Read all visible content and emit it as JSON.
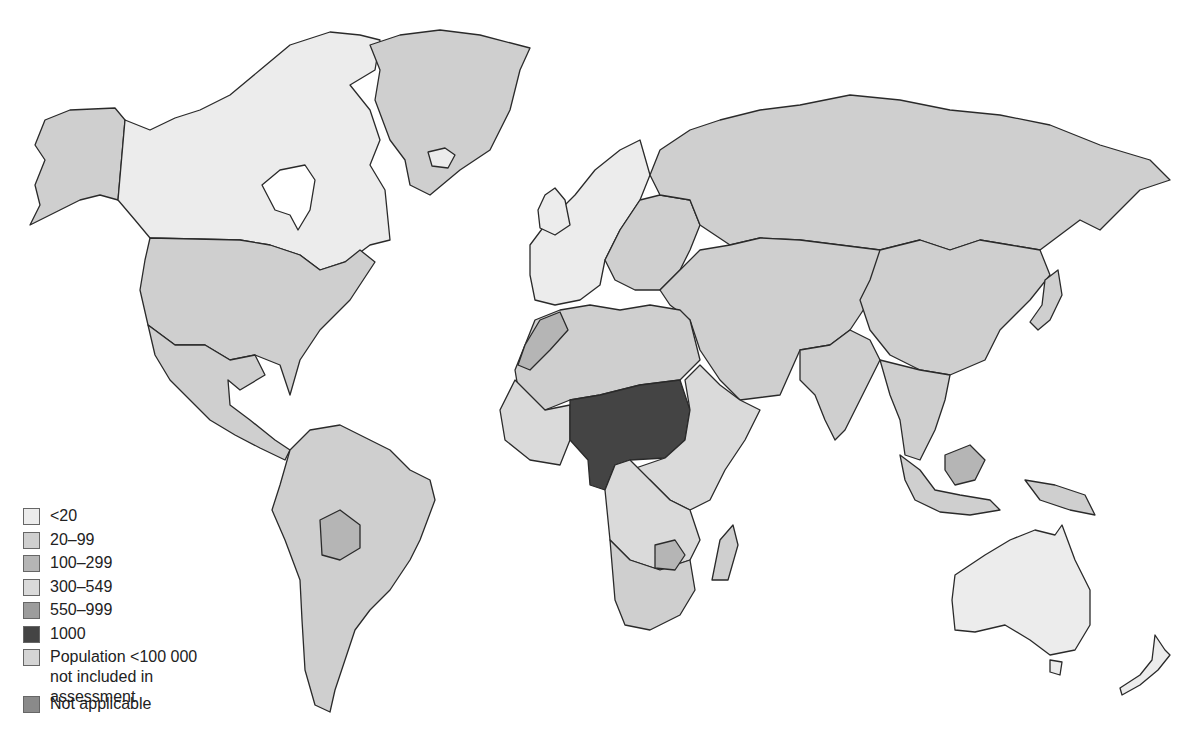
{
  "map": {
    "type": "choropleth",
    "subject": "World map shaded by category",
    "classes": [
      {
        "key": "lt20",
        "label": "<20",
        "color": "#ececec"
      },
      {
        "key": "c20_99",
        "label": "20–99",
        "color": "#cfcfcf"
      },
      {
        "key": "c100_299",
        "label": "100–299",
        "color": "#b5b5b5"
      },
      {
        "key": "c300_549",
        "label": "300–549",
        "color": "#dadada"
      },
      {
        "key": "c550_999",
        "label": "550–999",
        "color": "#9c9c9c"
      },
      {
        "key": "c1000",
        "label": "1000",
        "color": "#444444"
      },
      {
        "key": "small_pop",
        "label": "Population <100 000 not included in assessment",
        "color": "#d4d4d4"
      },
      {
        "key": "na",
        "label": "Not applicable",
        "color": "#8a8a8a"
      }
    ],
    "regions": [
      {
        "name": "Canada",
        "class": "lt20"
      },
      {
        "name": "Greenland",
        "class": "c20_99"
      },
      {
        "name": "Alaska (USA)",
        "class": "c20_99"
      },
      {
        "name": "United States",
        "class": "c20_99"
      },
      {
        "name": "Mexico & Central America",
        "class": "c20_99"
      },
      {
        "name": "South America",
        "class": "c20_99"
      },
      {
        "name": "Bolivia",
        "class": "c100_299"
      },
      {
        "name": "Western Europe",
        "class": "lt20"
      },
      {
        "name": "Eastern Europe",
        "class": "c20_99"
      },
      {
        "name": "Russia",
        "class": "c20_99"
      },
      {
        "name": "Central Asia & Middle East",
        "class": "c20_99"
      },
      {
        "name": "China",
        "class": "c20_99"
      },
      {
        "name": "India",
        "class": "c20_99"
      },
      {
        "name": "Southeast Asia",
        "class": "c20_99"
      },
      {
        "name": "Japan",
        "class": "c20_99"
      },
      {
        "name": "North Africa",
        "class": "c20_99"
      },
      {
        "name": "Morocco & Western Sahara",
        "class": "c100_299"
      },
      {
        "name": "Sahel & Central Africa",
        "class": "c1000"
      },
      {
        "name": "East Africa",
        "class": "c300_549"
      },
      {
        "name": "Southern Africa",
        "class": "c20_99"
      },
      {
        "name": "Zimbabwe",
        "class": "c100_299"
      },
      {
        "name": "Madagascar",
        "class": "c20_99"
      },
      {
        "name": "Australia",
        "class": "lt20"
      },
      {
        "name": "New Zealand",
        "class": "lt20"
      },
      {
        "name": "Papua New Guinea",
        "class": "c20_99"
      }
    ]
  },
  "legend": {
    "items": [
      {
        "label": "<20",
        "color": "#ececec"
      },
      {
        "label": "20–99",
        "color": "#cfcfcf"
      },
      {
        "label": "100–299",
        "color": "#b5b5b5"
      },
      {
        "label": "300–549",
        "color": "#dadada"
      },
      {
        "label": "550–999",
        "color": "#9c9c9c"
      },
      {
        "label": "1000",
        "color": "#444444"
      },
      {
        "label": "Population <100 000 not included in assessment",
        "color": "#d4d4d4"
      },
      {
        "label": "Not applicable",
        "color": "#8a8a8a"
      }
    ]
  }
}
